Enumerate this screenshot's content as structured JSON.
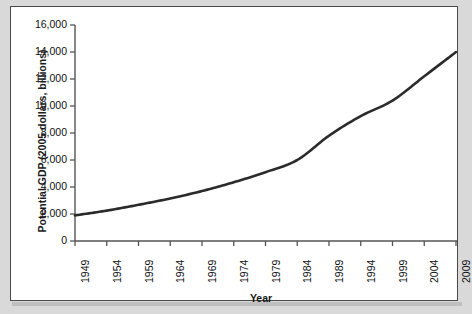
{
  "figure": {
    "background_color": "#d9d9d9",
    "card_background": "#ffffff",
    "border_color": "#4a4a4a"
  },
  "chart_data": {
    "type": "line",
    "title": "",
    "xlabel": "Year",
    "ylabel": "Potential GDP (2005 dollars, billions)",
    "xlim": [
      1949,
      2009
    ],
    "ylim": [
      0,
      16000
    ],
    "grid": false,
    "legend": false,
    "line_color": "#2b2b2b",
    "line_width": 2.6,
    "x_tick_labels": [
      "1949",
      "1954",
      "1959",
      "1964",
      "1969",
      "1974",
      "1979",
      "1984",
      "1989",
      "1994",
      "1999",
      "2004",
      "2009"
    ],
    "x_ticks": [
      1949,
      1954,
      1959,
      1964,
      1969,
      1974,
      1979,
      1984,
      1989,
      1994,
      1999,
      2004,
      2009
    ],
    "y_tick_labels": [
      "0",
      "2,000",
      "4,000",
      "6,000",
      "8,000",
      "10,000",
      "12,000",
      "14,000",
      "16,000"
    ],
    "y_ticks": [
      0,
      2000,
      4000,
      6000,
      8000,
      10000,
      12000,
      14000,
      16000
    ],
    "x": [
      1949,
      1954,
      1959,
      1964,
      1969,
      1974,
      1979,
      1984,
      1989,
      1994,
      1999,
      2004,
      2009
    ],
    "values": [
      1900,
      2250,
      2680,
      3150,
      3700,
      4350,
      5100,
      6000,
      7800,
      9250,
      10400,
      12200,
      14000
    ],
    "series": [
      {
        "name": "Potential GDP",
        "values": [
          1900,
          2250,
          2680,
          3150,
          3700,
          4350,
          5100,
          6000,
          7800,
          9250,
          10400,
          12200,
          14000
        ]
      }
    ]
  }
}
